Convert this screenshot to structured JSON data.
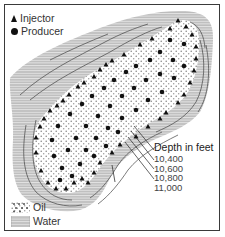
{
  "legend": {
    "injector_label": "Injector",
    "producer_label": "Producer",
    "oil_label": "Oil",
    "water_label": "Water"
  },
  "depth": {
    "title": "Depth in feet",
    "contours": [
      "10,400",
      "10,600",
      "10,800",
      "11,000"
    ]
  },
  "colors": {
    "water_fill": "#bdbdbd",
    "water_lines": "#e6e6e6",
    "oil_fill": "#ffffff",
    "oil_dots": "#8a8a8a",
    "contour": "#444444",
    "symbols": "#111111",
    "frame": "#3a3a3a"
  }
}
